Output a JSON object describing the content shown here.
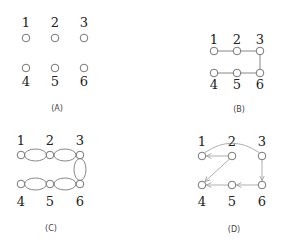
{
  "colors": {
    "node_stroke": "#666666",
    "edge": "#888888",
    "directed_edge": "#b0b0b0",
    "text": "#222222"
  },
  "panels": [
    {
      "id": "A",
      "caption": "(A)",
      "description": "Six isolated nodes in a 2x3 grid, no edges",
      "nodes": [
        {
          "label": "1",
          "x": 26,
          "y": 38,
          "label_y": 27
        },
        {
          "label": "2",
          "x": 55,
          "y": 38,
          "label_y": 27
        },
        {
          "label": "3",
          "x": 84,
          "y": 38,
          "label_y": 27
        },
        {
          "label": "4",
          "x": 26,
          "y": 68,
          "label_y": 86
        },
        {
          "label": "5",
          "x": 55,
          "y": 68,
          "label_y": 86
        },
        {
          "label": "6",
          "x": 84,
          "y": 68,
          "label_y": 86
        }
      ],
      "edges": [],
      "caption_pos": {
        "x": 57,
        "y": 111
      }
    },
    {
      "id": "B",
      "caption": "(B)",
      "description": "Path graph 1-2-3-6-5-4 with undirected edges",
      "nodes": [
        {
          "label": "1",
          "x": 214,
          "y": 51,
          "label_y": 44
        },
        {
          "label": "2",
          "x": 237,
          "y": 51,
          "label_y": 44
        },
        {
          "label": "3",
          "x": 260,
          "y": 51,
          "label_y": 44
        },
        {
          "label": "4",
          "x": 214,
          "y": 73,
          "label_y": 89
        },
        {
          "label": "5",
          "x": 237,
          "y": 73,
          "label_y": 89
        },
        {
          "label": "6",
          "x": 260,
          "y": 73,
          "label_y": 89
        }
      ],
      "edges": [
        [
          "1",
          "2"
        ],
        [
          "2",
          "3"
        ],
        [
          "3",
          "6"
        ],
        [
          "6",
          "5"
        ],
        [
          "5",
          "4"
        ]
      ],
      "caption_pos": {
        "x": 239,
        "y": 112
      }
    },
    {
      "id": "C",
      "caption": "(C)",
      "description": "Path graph with doubled (multi) edges drawn as ellipse pairs",
      "nodes": [
        {
          "label": "1",
          "x": 21,
          "y": 155,
          "label_y": 145
        },
        {
          "label": "2",
          "x": 50,
          "y": 155,
          "label_y": 145
        },
        {
          "label": "3",
          "x": 80,
          "y": 155,
          "label_y": 145
        },
        {
          "label": "4",
          "x": 21,
          "y": 184,
          "label_y": 206
        },
        {
          "label": "5",
          "x": 50,
          "y": 184,
          "label_y": 206
        },
        {
          "label": "6",
          "x": 80,
          "y": 184,
          "label_y": 206
        }
      ],
      "edges": [
        [
          "1",
          "2"
        ],
        [
          "2",
          "3"
        ],
        [
          "3",
          "6"
        ],
        [
          "6",
          "5"
        ],
        [
          "5",
          "4"
        ]
      ],
      "edge_style": "double-curved",
      "caption_pos": {
        "x": 51,
        "y": 231
      }
    },
    {
      "id": "D",
      "caption": "(D)",
      "description": "Directed cycle: 1 arc to 3, 3 to 6, 6 to 5, 5 to 4, 2 to 4 (diagonal), 2 to 1",
      "nodes": [
        {
          "label": "1",
          "x": 202,
          "y": 156,
          "label_y": 146
        },
        {
          "label": "2",
          "x": 232,
          "y": 156,
          "label_y": 146
        },
        {
          "label": "3",
          "x": 262,
          "y": 156,
          "label_y": 146
        },
        {
          "label": "4",
          "x": 202,
          "y": 185,
          "label_y": 206
        },
        {
          "label": "5",
          "x": 232,
          "y": 185,
          "label_y": 206
        },
        {
          "label": "6",
          "x": 262,
          "y": 185,
          "label_y": 206
        }
      ],
      "directed_edges": [
        {
          "from": "1",
          "to": "3",
          "style": "arc-over-top"
        },
        {
          "from": "3",
          "to": "6"
        },
        {
          "from": "6",
          "to": "5"
        },
        {
          "from": "5",
          "to": "4"
        },
        {
          "from": "2",
          "to": "4"
        },
        {
          "from": "2",
          "to": "1"
        }
      ],
      "caption_pos": {
        "x": 234,
        "y": 232
      }
    }
  ]
}
